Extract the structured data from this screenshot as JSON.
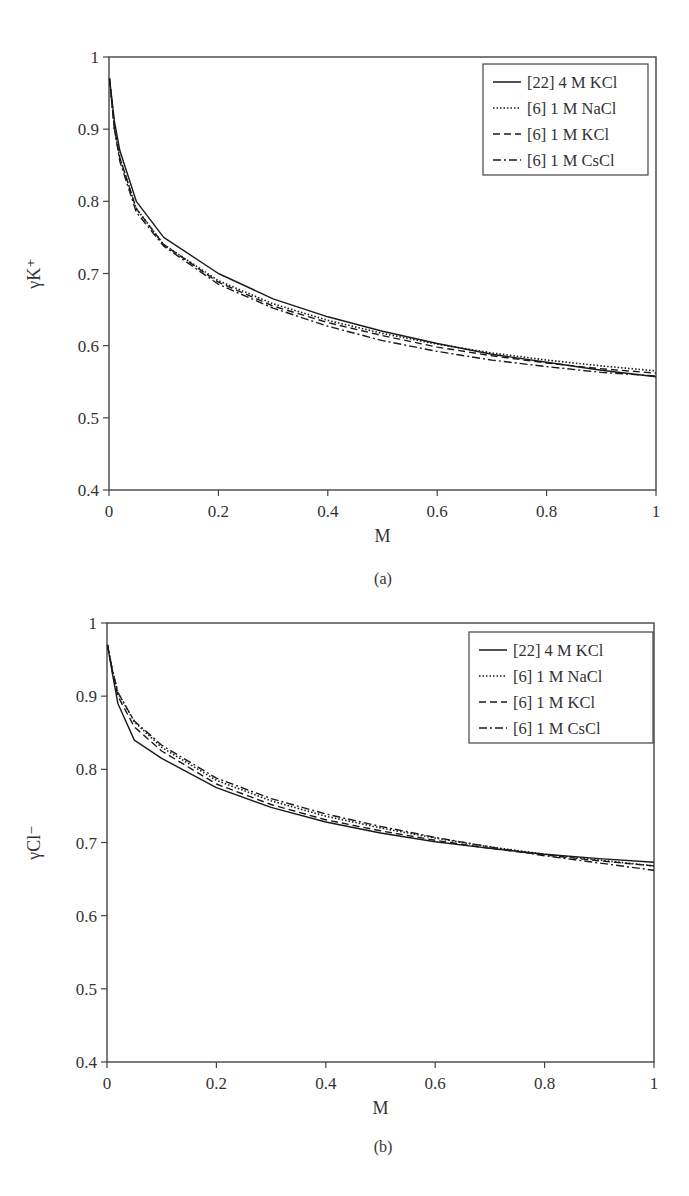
{
  "figure": {
    "panels": [
      {
        "id": "a",
        "panel_label": "(a)",
        "xlabel": "M",
        "ylabel": "γK⁺",
        "legend": [
          {
            "label": "[22] 4 M KCl",
            "style": "solid"
          },
          {
            "label": "[6] 1 M NaCl",
            "style": "dotted"
          },
          {
            "label": "[6] 1 M KCl",
            "style": "dashed"
          },
          {
            "label": "[6] 1 M CsCl",
            "style": "dashdot"
          }
        ]
      },
      {
        "id": "b",
        "panel_label": "(b)",
        "xlabel": "M",
        "ylabel": "γCl⁻",
        "legend": [
          {
            "label": "[22] 4 M KCl",
            "style": "solid"
          },
          {
            "label": "[6] 1 M NaCl",
            "style": "dotted"
          },
          {
            "label": "[6] 1 M KCl",
            "style": "dashed"
          },
          {
            "label": "[6] 1 M CsCl",
            "style": "dashdot"
          }
        ]
      }
    ],
    "x_ticks": [
      "0",
      "0.2",
      "0.4",
      "0.6",
      "0.8",
      "1"
    ],
    "y_ticks": [
      "0.4",
      "0.5",
      "0.6",
      "0.7",
      "0.8",
      "0.9",
      "1"
    ]
  },
  "chart_data": [
    {
      "type": "line",
      "title": "(a)",
      "xlabel": "M",
      "ylabel": "γK⁺",
      "xlim": [
        0,
        1
      ],
      "ylim": [
        0.4,
        1
      ],
      "grid": false,
      "legend_position": "upper right",
      "x": [
        0.001,
        0.01,
        0.02,
        0.05,
        0.1,
        0.2,
        0.3,
        0.4,
        0.5,
        0.6,
        0.7,
        0.8,
        0.9,
        1.0
      ],
      "series": [
        {
          "name": "[22] 4 M KCl",
          "style": "solid",
          "values": [
            0.97,
            0.91,
            0.87,
            0.8,
            0.75,
            0.7,
            0.665,
            0.64,
            0.62,
            0.603,
            0.588,
            0.577,
            0.566,
            0.557
          ]
        },
        {
          "name": "[6] 1 M NaCl",
          "style": "dotted",
          "values": [
            0.97,
            0.9,
            0.86,
            0.79,
            0.74,
            0.69,
            0.658,
            0.635,
            0.617,
            0.602,
            0.59,
            0.58,
            0.572,
            0.565
          ]
        },
        {
          "name": "[6] 1 M KCl",
          "style": "dashed",
          "values": [
            0.97,
            0.9,
            0.86,
            0.79,
            0.74,
            0.688,
            0.655,
            0.632,
            0.614,
            0.598,
            0.586,
            0.576,
            0.568,
            0.562
          ]
        },
        {
          "name": "[6] 1 M CsCl",
          "style": "dashdot",
          "values": [
            0.97,
            0.9,
            0.855,
            0.785,
            0.738,
            0.685,
            0.652,
            0.627,
            0.607,
            0.592,
            0.58,
            0.571,
            0.563,
            0.558
          ]
        }
      ]
    },
    {
      "type": "line",
      "title": "(b)",
      "xlabel": "M",
      "ylabel": "γCl⁻",
      "xlim": [
        0,
        1
      ],
      "ylim": [
        0.4,
        1
      ],
      "grid": false,
      "legend_position": "upper right",
      "x": [
        0.001,
        0.01,
        0.02,
        0.05,
        0.1,
        0.2,
        0.3,
        0.4,
        0.5,
        0.6,
        0.7,
        0.8,
        0.9,
        1.0
      ],
      "series": [
        {
          "name": "[22] 4 M KCl",
          "style": "solid",
          "values": [
            0.97,
            0.93,
            0.89,
            0.84,
            0.815,
            0.775,
            0.748,
            0.728,
            0.713,
            0.701,
            0.692,
            0.684,
            0.678,
            0.673
          ]
        },
        {
          "name": "[6] 1 M NaCl",
          "style": "dotted",
          "values": [
            0.97,
            0.935,
            0.905,
            0.865,
            0.83,
            0.785,
            0.757,
            0.736,
            0.72,
            0.706,
            0.694,
            0.684,
            0.676,
            0.668
          ]
        },
        {
          "name": "[6] 1 M KCl",
          "style": "dashed",
          "values": [
            0.97,
            0.933,
            0.9,
            0.858,
            0.825,
            0.78,
            0.752,
            0.731,
            0.716,
            0.703,
            0.692,
            0.683,
            0.675,
            0.668
          ]
        },
        {
          "name": "[6] 1 M CsCl",
          "style": "dashdot",
          "values": [
            0.97,
            0.935,
            0.905,
            0.866,
            0.833,
            0.788,
            0.76,
            0.739,
            0.722,
            0.707,
            0.694,
            0.682,
            0.672,
            0.662
          ]
        }
      ]
    }
  ]
}
